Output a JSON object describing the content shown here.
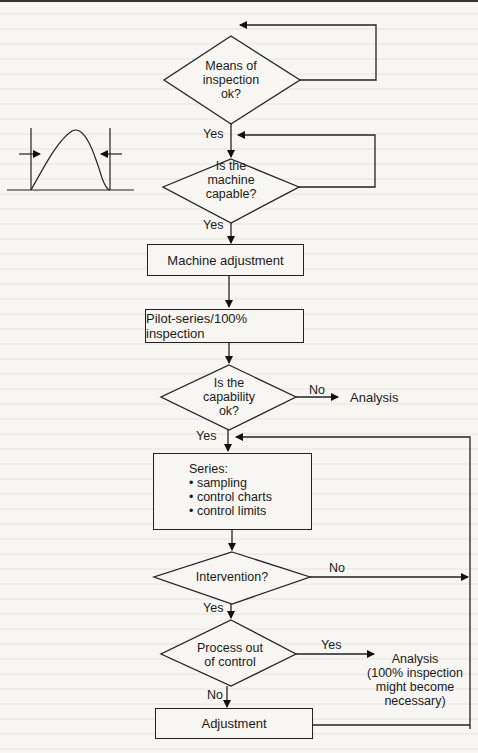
{
  "diagram": {
    "decisions": {
      "means_of_inspection": [
        "Means of",
        "inspection",
        "ok?"
      ],
      "machine_capable": [
        "Is the",
        "machine",
        "capable?"
      ],
      "capability_ok": [
        "Is the",
        "capability",
        "ok?"
      ],
      "intervention": "Intervention?",
      "process_out_of_control": [
        "Process out",
        "of control"
      ]
    },
    "processes": {
      "machine_adjustment": "Machine adjustment",
      "pilot_series": "Pilot-series/100% inspection",
      "series_title": "Series:",
      "series_items": [
        "sampling",
        "control charts",
        "control limits"
      ],
      "adjustment": "Adjustment"
    },
    "outcomes": {
      "analysis": "Analysis",
      "analysis_100": [
        "Analysis",
        "(100% inspection",
        "might become",
        "necessary)"
      ]
    },
    "edge_labels": {
      "yes_1": "Yes",
      "yes_2": "Yes",
      "no_capability": "No",
      "yes_capability": "Yes",
      "no_intervention": "No",
      "yes_intervention": "Yes",
      "yes_out_of_control": "Yes",
      "no_out_of_control": "No"
    },
    "bullet": "•"
  }
}
